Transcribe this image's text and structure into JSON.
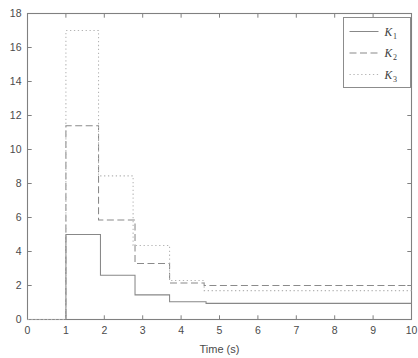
{
  "chart_data": {
    "type": "line",
    "title": "",
    "subtitle": "",
    "xlabel": "Time (s)",
    "ylabel": "",
    "xlim": [
      0,
      10
    ],
    "ylim": [
      0,
      18
    ],
    "grid": false,
    "step_style": "post",
    "legend_position": "top-right",
    "xticks": [
      0,
      1,
      2,
      3,
      4,
      5,
      6,
      7,
      8,
      9,
      10
    ],
    "xtick_labels": [
      "0",
      "1",
      "2",
      "3",
      "4",
      "5",
      "6",
      "7",
      "8",
      "9",
      "10"
    ],
    "yticks": [
      0,
      2,
      4,
      6,
      8,
      10,
      12,
      14,
      16,
      18
    ],
    "ytick_labels": [
      "0",
      "2",
      "4",
      "6",
      "8",
      "10",
      "12",
      "14",
      "16",
      "18"
    ],
    "series": [
      {
        "name": "K1",
        "legend_label": "K",
        "legend_subscript": "1",
        "style": "solid",
        "color": "#888888",
        "x": [
          0,
          1,
          1.9,
          2.8,
          3.7,
          4.65,
          10
        ],
        "values": [
          0,
          5.0,
          2.6,
          1.45,
          1.05,
          0.95,
          0.95
        ]
      },
      {
        "name": "K2",
        "legend_label": "K",
        "legend_subscript": "2",
        "style": "dashed",
        "color": "#8a8a8a",
        "x": [
          0,
          1,
          1.85,
          2.8,
          3.7,
          4.6,
          10
        ],
        "values": [
          0,
          11.4,
          5.85,
          3.3,
          2.15,
          2.0,
          2.0
        ]
      },
      {
        "name": "K3",
        "legend_label": "K",
        "legend_subscript": "3",
        "style": "dotted",
        "color": "#b4b4b4",
        "x": [
          0,
          1,
          1.85,
          2.75,
          3.7,
          4.6,
          10
        ],
        "values": [
          0,
          17.0,
          8.45,
          4.35,
          2.3,
          1.7,
          1.7
        ]
      }
    ],
    "colors": {
      "axis": "#808080",
      "text": "#4a4a4a",
      "background": "#ffffff",
      "legend_border": "#8c8c8c"
    }
  }
}
